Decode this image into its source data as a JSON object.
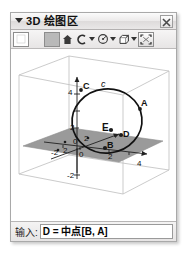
{
  "window": {
    "title": "3D 绘图区",
    "collapse_icon": "triangle-down-icon",
    "close_icon": "close-icon",
    "close_label": "X"
  },
  "toolbar": {
    "items": [
      {
        "name": "move-tool",
        "icon": "white-square-icon",
        "has_caret": false
      },
      {
        "name": "point-tool",
        "icon": "gray-square-icon",
        "has_caret": false
      },
      {
        "name": "line-tool",
        "icon": "home-icon",
        "has_caret": false
      },
      {
        "name": "circle-tool",
        "icon": "arc-icon",
        "has_caret": true
      },
      {
        "name": "sphere-tool",
        "icon": "circle-dot-icon",
        "has_caret": true
      },
      {
        "name": "solid-tool",
        "icon": "cube-icon",
        "has_caret": true
      },
      {
        "name": "view-fit-tool",
        "icon": "fit-view-icon",
        "has_caret": false
      }
    ]
  },
  "graphics": {
    "axis_labels": {
      "x_neg2": "-2",
      "x_2": "2",
      "x_4": "4",
      "y_2": "2",
      "y_neg2": "-2",
      "z_4": "4",
      "z_2": "2",
      "z_neg2": "-2",
      "origin": "0"
    },
    "points": [
      {
        "name": "point-A",
        "label": "A"
      },
      {
        "name": "point-B",
        "label": "B"
      },
      {
        "name": "point-C",
        "label": "C"
      },
      {
        "name": "point-D",
        "label": "D"
      },
      {
        "name": "point-E",
        "label": "E"
      }
    ],
    "curves": [
      {
        "name": "circle-c",
        "label": "c"
      }
    ],
    "plane_color": "#9a9a9a",
    "curve_color": "#111111",
    "box_color": "#bdbdbd"
  },
  "input_bar": {
    "label": "输入:",
    "value": "D = 中点[B, A]",
    "placeholder": ""
  }
}
